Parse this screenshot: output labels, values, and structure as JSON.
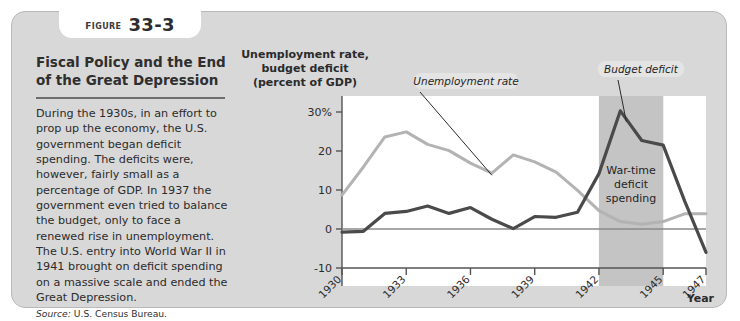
{
  "figure": {
    "tab_word": "FIGURE",
    "tab_number": "33-3",
    "title": "Fiscal Policy and the End of the Great Depression",
    "body": "During the 1930s, in an effort to prop up the economy, the U.S. government began deficit spending. The deficits were, however, fairly small as a percentage of GDP. In 1937 the government even tried to balance the budget, only to face a renewed rise in unemployment. The U.S. entry into World War II in 1941 brought on deficit spending on a massive scale and ended the Great Depression.",
    "source_label": "Source:",
    "source_text": "U.S. Census Bureau."
  },
  "chart_data": {
    "type": "line",
    "title": "",
    "ylabel": "Unemployment rate, budget deficit (percent of GDP)",
    "xlabel": "Year",
    "ylim": [
      -10,
      32
    ],
    "xlim": [
      1930,
      1947
    ],
    "grid": false,
    "yticks": [
      30,
      20,
      10,
      0,
      -10
    ],
    "ytick_labels": [
      "30%",
      "20",
      "10",
      "0",
      "-10"
    ],
    "xticks": [
      1930,
      1933,
      1936,
      1939,
      1942,
      1945,
      1947
    ],
    "xtick_labels": [
      "1930",
      "1933",
      "1936",
      "1939",
      "1942",
      "1945",
      "1947"
    ],
    "x": [
      1930,
      1931,
      1932,
      1933,
      1934,
      1935,
      1936,
      1937,
      1938,
      1939,
      1940,
      1941,
      1942,
      1943,
      1944,
      1945,
      1946,
      1947
    ],
    "series": [
      {
        "name": "Unemployment rate",
        "color": "#b3b3b3",
        "values": [
          8.7,
          15.9,
          23.6,
          24.9,
          21.7,
          20.1,
          16.9,
          14.3,
          19.0,
          17.2,
          14.6,
          9.9,
          4.7,
          1.9,
          1.2,
          1.9,
          3.9,
          3.9
        ]
      },
      {
        "name": "Budget deficit",
        "color": "#4a4a4a",
        "values": [
          -0.8,
          -0.6,
          4.0,
          4.5,
          5.9,
          4.0,
          5.5,
          2.5,
          0.1,
          3.2,
          3.0,
          4.3,
          14.2,
          30.3,
          22.7,
          21.5,
          7.2,
          -6.0
        ]
      }
    ],
    "annotations": [
      {
        "name": "unemployment-callout",
        "text": "Unemployment rate"
      },
      {
        "name": "budget-deficit-callout",
        "text": "Budget deficit"
      },
      {
        "name": "war-band-label",
        "text": [
          "War-time",
          "deficit",
          "spending"
        ]
      }
    ],
    "shaded_band": {
      "name": "war-time-band",
      "label": "War-time deficit spending",
      "x_start": 1942,
      "x_end": 1945,
      "color": "#c4c4c4"
    },
    "zero_line": 0,
    "legend": "none"
  }
}
